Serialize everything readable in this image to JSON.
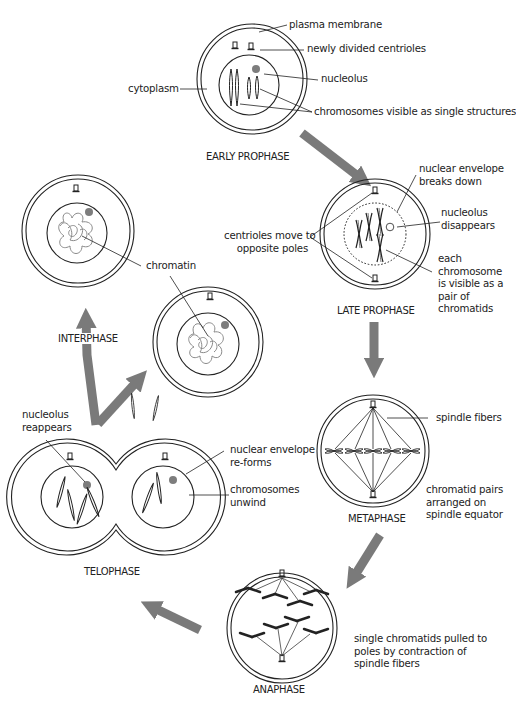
{
  "diagram": {
    "arrow_color": "#7a7a7a",
    "line_color": "#222222",
    "nucleolus_color": "#7d7d7d",
    "chromatin_color": "#8a8a8a",
    "stages": {
      "early_prophase": "EARLY PROPHASE",
      "late_prophase": "LATE PROPHASE",
      "metaphase": "METAPHASE",
      "anaphase": "ANAPHASE",
      "telophase": "TELOPHASE",
      "interphase": "INTERPHASE"
    },
    "labels": {
      "plasma_membrane": "plasma membrane",
      "newly_divided_centrioles": "newly divided centrioles",
      "cytoplasm": "cytoplasm",
      "nucleolus": "nucleolus",
      "chromosomes_single": "chromosomes visible as single structures",
      "nuclear_envelope_breaks_1": "nuclear envelope",
      "nuclear_envelope_breaks_2": "breaks down",
      "nucleolus_disappears_1": "nucleolus",
      "nucleolus_disappears_2": "disappears",
      "centrioles_move_1": "centrioles move to",
      "centrioles_move_2": "opposite poles",
      "chromatids_1": "each",
      "chromatids_2": "chromosome",
      "chromatids_3": "is visible as a",
      "chromatids_4": "pair of",
      "chromatids_5": "chromatids",
      "chromatin": "chromatin",
      "spindle_fibers": "spindle fibers",
      "chromatid_pairs_1": "chromatid pairs",
      "chromatid_pairs_2": "arranged on",
      "chromatid_pairs_3": "spindle equator",
      "nucleolus_reappears_1": "nucleolus",
      "nucleolus_reappears_2": "reappears",
      "nuclear_envelope_reforms_1": "nuclear envelope",
      "nuclear_envelope_reforms_2": "re-forms",
      "chromosomes_unwind_1": "chromosomes",
      "chromosomes_unwind_2": "unwind",
      "single_chromatids_1": "single chromatids pulled to",
      "single_chromatids_2": "poles by contraction of",
      "single_chromatids_3": "spindle fibers"
    }
  }
}
